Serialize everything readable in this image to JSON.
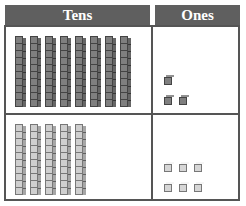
{
  "headers": {
    "tens": "Tens",
    "ones": "Ones"
  },
  "rows": [
    {
      "tens_rods": 8,
      "ones_cubes": 3,
      "shade": "dark",
      "value": 83
    },
    {
      "tens_rods": 5,
      "ones_cubes": 6,
      "shade": "light",
      "value": 56
    }
  ],
  "colors": {
    "header_bg": "#5f5f5f",
    "dark_block": "#7f7f7f",
    "light_block": "#d6d6d6",
    "border": "#555555"
  }
}
